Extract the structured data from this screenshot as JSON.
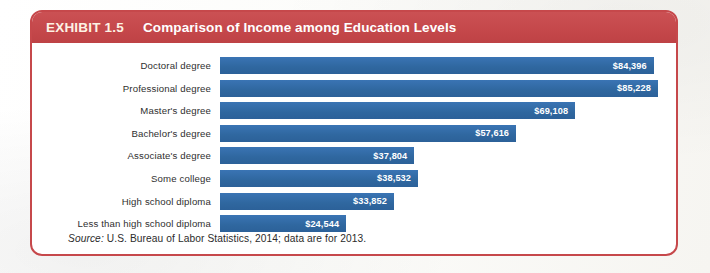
{
  "exhibit": {
    "label": "EXHIBIT 1.5",
    "title": "Comparison of Income among Education Levels",
    "source_word": "Source:",
    "source_text": " U.S. Bureau of Labor Statistics, 2014; data are for 2013."
  },
  "colors": {
    "header_red": "#c5484b",
    "bar_blue": "#2f679f",
    "card_border": "#c6484b",
    "value_text": "#ffffff",
    "label_text": "#2f2f2f"
  },
  "chart_data": {
    "type": "bar",
    "orientation": "horizontal",
    "title": "Comparison of Income among Education Levels",
    "xlabel": "",
    "ylabel": "",
    "grid": false,
    "legend": "none",
    "xlim": [
      0,
      90000
    ],
    "value_prefix": "$",
    "categories": [
      "Doctoral degree",
      "Professional degree",
      "Master's degree",
      "Bachelor's degree",
      "Associate's degree",
      "Some college",
      "High school diploma",
      "Less than high school diploma"
    ],
    "values": [
      84396,
      85228,
      69108,
      57616,
      37804,
      38532,
      33852,
      24544
    ],
    "value_labels": [
      "$84,396",
      "$85,228",
      "$69,108",
      "$57,616",
      "$37,804",
      "$38,532",
      "$33,852",
      "$24,544"
    ]
  }
}
